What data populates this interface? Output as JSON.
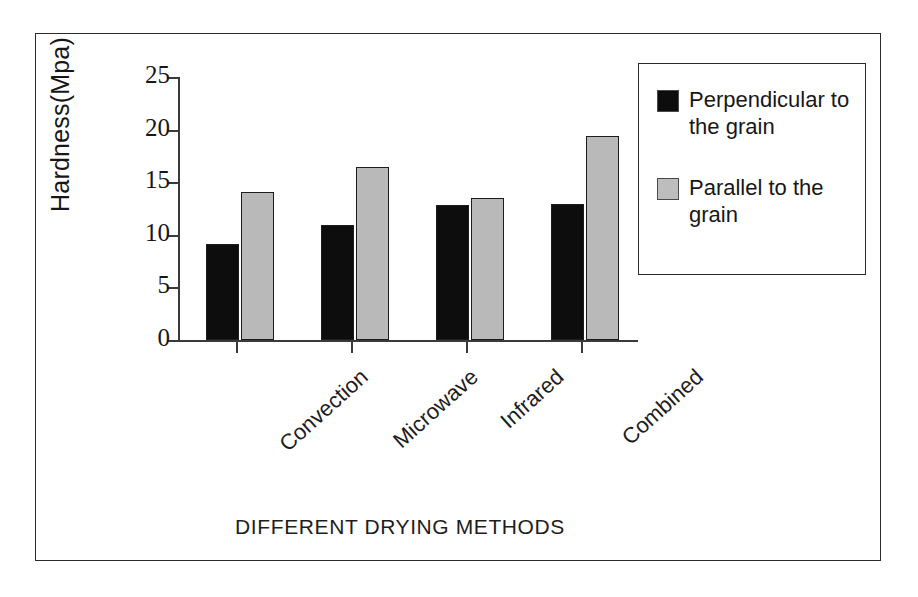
{
  "chart_data": {
    "type": "bar",
    "title": "",
    "xlabel": "DIFFERENT DRYING METHODS",
    "ylabel": "Hardness(Mpa)",
    "categories": [
      "Convection",
      "Microwave",
      "Infrared",
      "Combined"
    ],
    "series": [
      {
        "name": "Perpendicular to the grain",
        "color": "#0d0d0d",
        "values": [
          9.1,
          10.9,
          12.8,
          12.9
        ]
      },
      {
        "name": "Parallel to the grain",
        "color": "#b9b9b9",
        "values": [
          14.1,
          16.4,
          13.5,
          19.4
        ]
      }
    ],
    "ylim": [
      0,
      25
    ],
    "yticks": [
      0,
      5,
      10,
      15,
      20,
      25
    ],
    "ytick_labels": [
      "0",
      "5",
      "10",
      "15",
      "20",
      "25"
    ],
    "grid": false,
    "legend_position": "upper right",
    "legend_entries": [
      "Perpendicular to the grain",
      "Parallel to the grain"
    ]
  }
}
